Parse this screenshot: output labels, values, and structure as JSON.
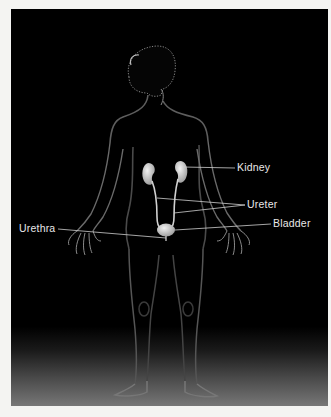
{
  "diagram": {
    "labels": {
      "kidney": "Kidney",
      "ureter": "Ureter",
      "bladder": "Bladder",
      "urethra": "Urethra"
    },
    "colors": {
      "background": "#000000",
      "organ": "#d8d8d8",
      "leader_line": "#cfcfcf",
      "label_text": "#e8e8e8",
      "body_rim": "#6a6a6a"
    }
  }
}
